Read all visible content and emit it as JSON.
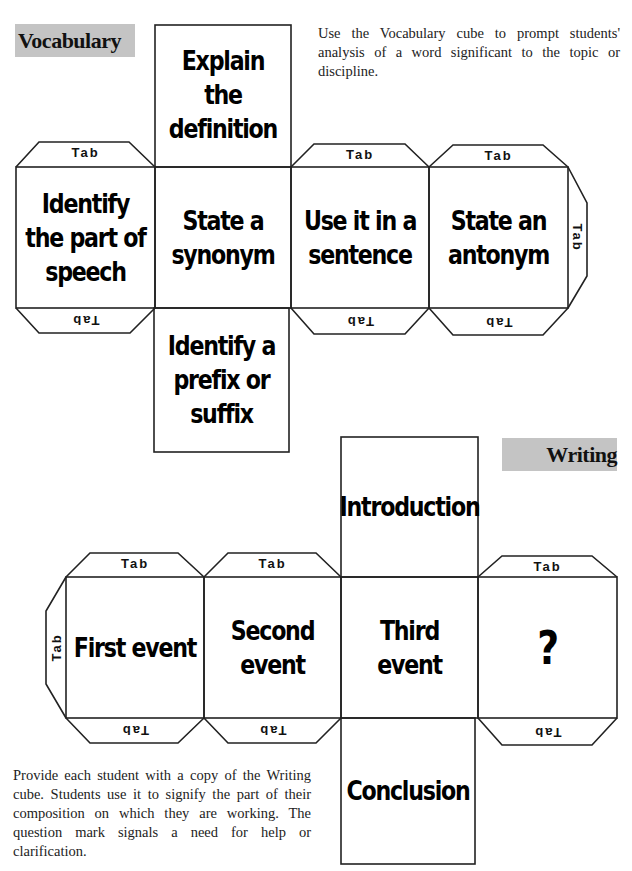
{
  "vocabulary": {
    "label": "Vocabulary",
    "description": "Use the Vocabulary cube to prompt students' analysis of a word significant to the topic or discipline.",
    "faces": {
      "top": "Explain the definition",
      "row": [
        "Identify the part of speech",
        "State a synonym",
        "Use it in a sentence",
        "State an antonym"
      ],
      "bottom": "Identify a prefix or suffix"
    },
    "tab_label": "Tab"
  },
  "writing": {
    "label": "Writing",
    "description": "Provide each student with a copy of the Writing cube. Students use it to signify the part of their composition on which they are working. The question mark signals a need for help or clarification.",
    "faces": {
      "top": "Introduction",
      "row": [
        "First event",
        "Second event",
        "Third event",
        "?"
      ],
      "bottom": "Conclusion"
    },
    "tab_label": "Tab"
  },
  "colors": {
    "label_bg": "#c4c4c4",
    "line": "#222222"
  }
}
